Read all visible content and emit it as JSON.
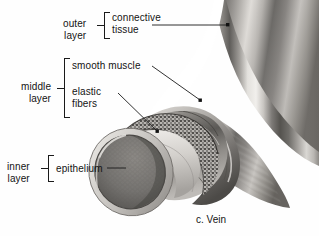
{
  "figure": {
    "caption": "c. Vein",
    "palette": {
      "background": "#fefefe",
      "ink": "#141414",
      "leader_line": "#1a1a1a",
      "tissue_light": "#e8e6e2",
      "tissue_mid": "#9e9a95",
      "tissue_dark": "#4a4845",
      "lumen": "#6f6c69",
      "stipple": "#2e2c2a"
    }
  },
  "labels": {
    "outer": {
      "group": "outer\nlayer",
      "items": [
        {
          "text": "connective\ntissue",
          "leader": "long-horizontal-to-tube-wall"
        }
      ]
    },
    "middle": {
      "group": "middle\nlayer",
      "items": [
        {
          "text": "smooth muscle",
          "leader": "diagonal-to-muscle-band"
        },
        {
          "text": "elastic\nfibers",
          "leader": "diagonal-to-elastic-band"
        }
      ]
    },
    "inner": {
      "group": "inner\nlayer",
      "items": [
        {
          "text": "epithelium",
          "leader": "short-horizontal-to-lumen-rim"
        }
      ]
    }
  }
}
